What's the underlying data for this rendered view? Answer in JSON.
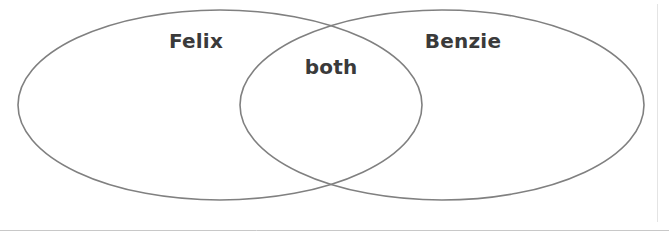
{
  "diagram": {
    "type": "venn-two-set",
    "background_color": "#ffffff",
    "stroke_color": "#808080",
    "stroke_width": 1.6,
    "text_color": "#3a3a3a",
    "sets": [
      {
        "id": "left",
        "label": "Felix",
        "label_x": 196,
        "label_y": 42,
        "cx": 220,
        "cy": 105,
        "rx": 202,
        "ry": 95
      },
      {
        "id": "right",
        "label": "Benzie",
        "label_x": 463,
        "label_y": 42,
        "cx": 442,
        "cy": 105,
        "rx": 202,
        "ry": 95
      }
    ],
    "intersection": {
      "label": "both",
      "label_x": 331,
      "label_y": 68
    },
    "rules": [
      {
        "id": "bottom-rule",
        "orientation": "horizontal",
        "x1": 0,
        "y1": 230.5,
        "x2": 669,
        "y2": 230.5,
        "color": "#c8c8c8",
        "width": 1
      },
      {
        "id": "right-margin-rule",
        "orientation": "vertical",
        "x1": 657.5,
        "y1": 4,
        "x2": 657.5,
        "y2": 222,
        "color": "#e4e4e4",
        "width": 1
      }
    ]
  }
}
